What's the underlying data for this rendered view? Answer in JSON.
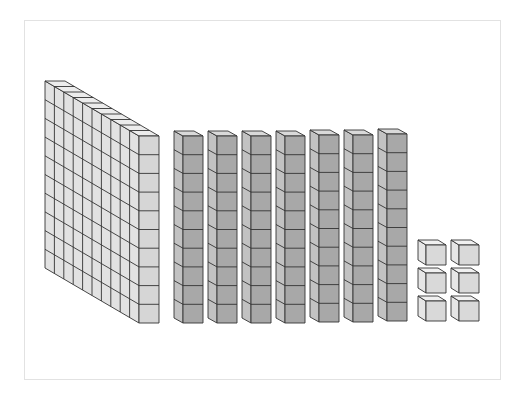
{
  "diagram": {
    "represented_number": 176,
    "colors": {
      "flat_front": "#d6d6d6",
      "flat_side": "#e2e2e2",
      "flat_top": "#ececec",
      "rod_front": "#a8a8a8",
      "rod_side": "#c2c2c2",
      "rod_top": "#d9d9d9",
      "unit_front": "#d9d9d9",
      "unit_side": "#e6e6e6",
      "unit_top": "#f0f0f0",
      "stroke": "#333333",
      "frame": "#e2e2e2"
    },
    "flats": [
      {
        "label": "hundred flat",
        "value": 100,
        "x": 139,
        "y": 136,
        "cell_w": 20,
        "cell_h": 18.7,
        "rows": 10,
        "cols": 10,
        "dx": -9.4,
        "dy": -5.5
      }
    ],
    "rods": [
      {
        "label": "ten rod",
        "value": 10,
        "x": 183,
        "y": 136
      },
      {
        "label": "ten rod",
        "value": 10,
        "x": 217,
        "y": 136
      },
      {
        "label": "ten rod",
        "value": 10,
        "x": 251,
        "y": 136
      },
      {
        "label": "ten rod",
        "value": 10,
        "x": 285,
        "y": 136
      },
      {
        "label": "ten rod",
        "value": 10,
        "x": 319,
        "y": 135
      },
      {
        "label": "ten rod",
        "value": 10,
        "x": 353,
        "y": 135
      },
      {
        "label": "ten rod",
        "value": 10,
        "x": 387,
        "y": 134
      }
    ],
    "rod_geometry": {
      "cell_w": 20,
      "cell_h": 18.7,
      "cells": 10,
      "dx": -9,
      "dy": -5
    },
    "units": [
      {
        "label": "unit cube",
        "value": 1,
        "x": 426,
        "y": 245
      },
      {
        "label": "unit cube",
        "value": 1,
        "x": 459,
        "y": 245
      },
      {
        "label": "unit cube",
        "value": 1,
        "x": 426,
        "y": 273
      },
      {
        "label": "unit cube",
        "value": 1,
        "x": 459,
        "y": 273
      },
      {
        "label": "unit cube",
        "value": 1,
        "x": 426,
        "y": 301
      },
      {
        "label": "unit cube",
        "value": 1,
        "x": 459,
        "y": 301
      }
    ],
    "unit_geometry": {
      "w": 20,
      "h": 20,
      "dx": -8,
      "dy": -5
    },
    "counts": {
      "hundreds": 1,
      "tens": 7,
      "ones": 6
    }
  }
}
